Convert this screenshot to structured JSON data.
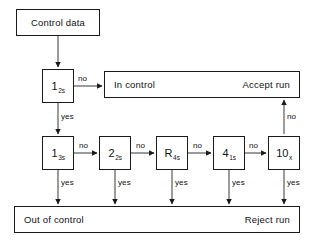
{
  "diagram": {
    "stroke_color": "#1a1a1a",
    "shadow_color": "#5c5c5c",
    "background_color": "#ffffff"
  },
  "nodes": {
    "control_data": {
      "label": "Control data"
    },
    "in_control": {
      "left_label": "In control",
      "right_label": "Accept run"
    },
    "out_of_control": {
      "left_label": "Out of control",
      "right_label": "Reject run"
    },
    "rule_1_2s": {
      "base": "1",
      "sub": "2s"
    },
    "rule_1_3s": {
      "base": "1",
      "sub": "3s"
    },
    "rule_2_2s": {
      "base": "2",
      "sub": "2s"
    },
    "rule_r_4s": {
      "base": "R",
      "sub": "4s"
    },
    "rule_4_1s": {
      "base": "4",
      "sub": "1s"
    },
    "rule_10_x": {
      "base": "10",
      "sub": "x"
    }
  },
  "edges": {
    "no_1_2s_to_in_control": "no",
    "yes_1_2s_to_1_3s": "yes",
    "no_1_3s_to_2_2s": "no",
    "no_2_2s_to_r_4s": "no",
    "no_r_4s_to_4_1s": "no",
    "no_4_1s_to_10_x": "no",
    "no_10_x_to_accept": "no",
    "yes_1_3s_to_reject": "yes",
    "yes_2_2s_to_reject": "yes",
    "yes_r_4s_to_reject": "yes",
    "yes_4_1s_to_reject": "yes",
    "yes_10_x_to_reject": "yes"
  }
}
